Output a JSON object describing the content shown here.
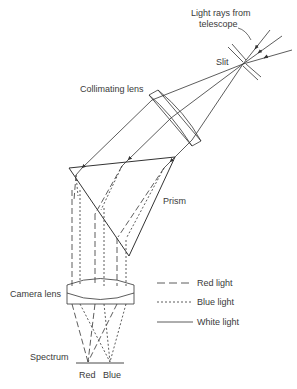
{
  "labels": {
    "light_source": "Light rays from telescope",
    "light_source_line1": "Light rays from",
    "light_source_line2": "telescope",
    "slit": "Slit",
    "collimating_lens": "Collimating lens",
    "prism": "Prism",
    "camera_lens": "Camera lens",
    "spectrum": "Spectrum",
    "red": "Red",
    "blue": "Blue"
  },
  "legend": [
    {
      "style": "long-dash",
      "label": "Red light"
    },
    {
      "style": "short-dash",
      "label": "Blue light"
    },
    {
      "style": "solid",
      "label": "White light"
    }
  ],
  "colors": {
    "line": "#333333",
    "text": "#3a3a3a",
    "background": "#ffffff"
  }
}
